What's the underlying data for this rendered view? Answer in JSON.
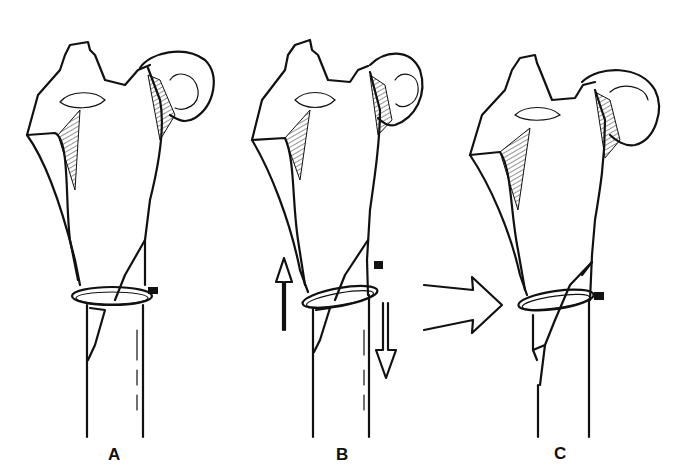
{
  "figure": {
    "panels": [
      {
        "label": "A",
        "state": "fracture with cerclage wire"
      },
      {
        "label": "B",
        "state": "opposing vertical arrows (up and down) indicating shear"
      },
      {
        "label": "C",
        "state": "result after horizontal compression arrow"
      }
    ],
    "arrows": [
      {
        "panel": "B",
        "direction": "up"
      },
      {
        "panel": "B",
        "direction": "down"
      },
      {
        "between": "B-C",
        "direction": "right"
      }
    ],
    "colors": {
      "ink": "#111111",
      "background": "#ffffff"
    }
  }
}
